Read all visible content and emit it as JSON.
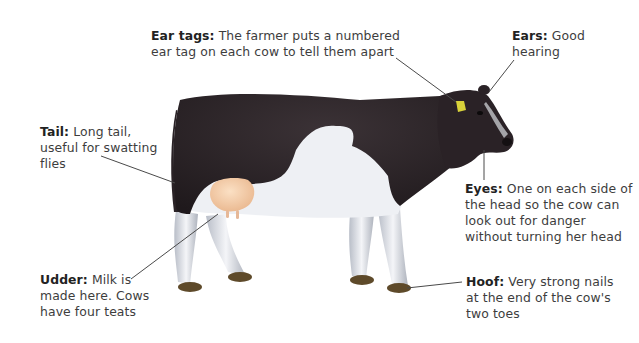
{
  "diagram": {
    "colors": {
      "coat_black": "#2a2226",
      "coat_white": "#eef0f4",
      "leg_shade": "#c6cad3",
      "udder": "#f2c8a0",
      "hoof": "#5e4a2a",
      "ear_tag": "#d8d23a",
      "leader_line": "#4a4a4a"
    },
    "labels": [
      {
        "id": "ear-tags",
        "term": "Ear tags:",
        "lines": [
          " The farmer puts a numbered",
          "ear tag on each cow to tell them apart"
        ]
      },
      {
        "id": "ears",
        "term": "Ears:",
        "lines": [
          " Good",
          "hearing"
        ]
      },
      {
        "id": "tail",
        "term": "Tail:",
        "lines": [
          " Long tail,",
          "useful for swatting",
          "flies"
        ]
      },
      {
        "id": "eyes",
        "term": "Eyes:",
        "lines": [
          " One on each side of",
          "the head so the cow can",
          "look out for danger",
          "without turning her head"
        ]
      },
      {
        "id": "udder",
        "term": "Udder:",
        "lines": [
          " Milk is",
          "made here. Cows",
          "have four teats"
        ]
      },
      {
        "id": "hoof",
        "term": "Hoof:",
        "lines": [
          " Very strong nails",
          "at the end of the cow's",
          "two toes"
        ]
      }
    ]
  }
}
